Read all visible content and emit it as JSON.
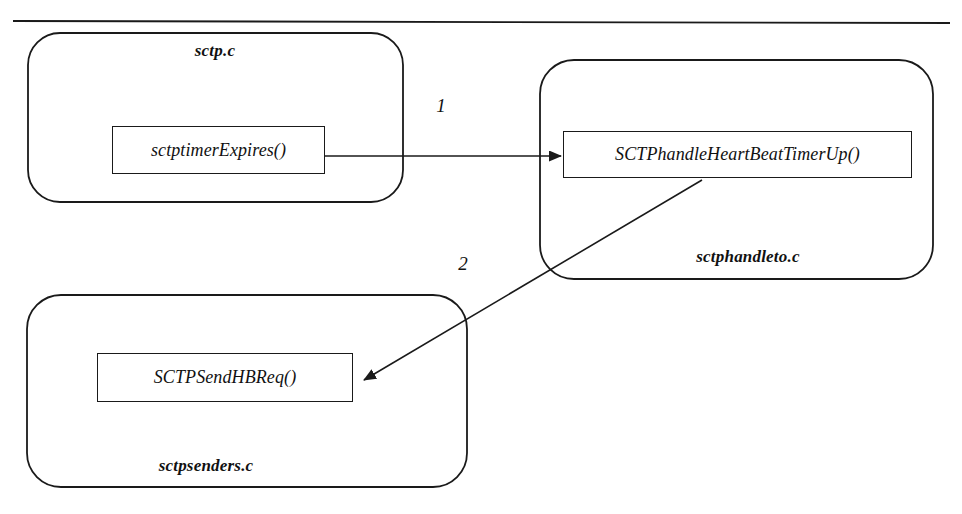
{
  "diagram": {
    "type": "call-flow",
    "title_rule": {
      "visible": true,
      "x1": 13,
      "y1": 21,
      "x2": 950,
      "y2": 23
    },
    "modules": [
      {
        "id": "sctp-c",
        "label": "sctp.c",
        "label_x": 215,
        "label_y": 51,
        "x": 28,
        "y": 33,
        "w": 375,
        "h": 169,
        "r": 32,
        "function": {
          "name": "sctptimerExpires()",
          "x": 112,
          "y": 126,
          "w": 213,
          "h": 48
        }
      },
      {
        "id": "sctphandleto-c",
        "label": "sctphandleto.c",
        "label_x": 748,
        "label_y": 257,
        "x": 540,
        "y": 60,
        "w": 393,
        "h": 219,
        "r": 34,
        "function": {
          "name": "SCTPhandleHeartBeatTimerUp()",
          "x": 563,
          "y": 131,
          "w": 349,
          "h": 47
        }
      },
      {
        "id": "sctpsenders-c",
        "label": "sctpsenders.c",
        "label_x": 206,
        "label_y": 466,
        "x": 27,
        "y": 295,
        "w": 440,
        "h": 192,
        "r": 34,
        "function": {
          "name": "SCTPSendHBReq()",
          "x": 97,
          "y": 353,
          "w": 256,
          "h": 49
        }
      }
    ],
    "edges": [
      {
        "id": "edge-1",
        "label": "1",
        "label_x": 441,
        "label_y": 106,
        "from": "sctptimerExpires()",
        "to": "SCTPhandleHeartBeatTimerUp()",
        "x1": 325,
        "y1": 156,
        "x2": 561,
        "y2": 156
      },
      {
        "id": "edge-2",
        "label": "2",
        "label_x": 463,
        "label_y": 264,
        "from": "SCTPhandleHeartBeatTimerUp()",
        "to": "SCTPSendHBReq()",
        "x1": 702,
        "y1": 180,
        "x2": 364,
        "y2": 380
      }
    ],
    "colors": {
      "stroke": "#1a1a1a",
      "background": "#ffffff",
      "text": "#111111"
    }
  }
}
